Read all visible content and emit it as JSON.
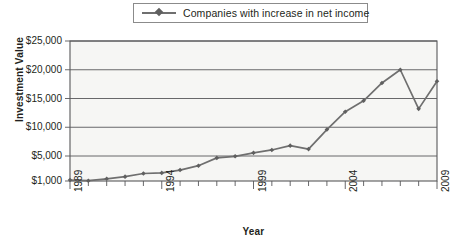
{
  "legend": {
    "entries": [
      {
        "label": "Companies with increase in net income",
        "color": "#6f6f6f",
        "marker": "diamond"
      }
    ]
  },
  "axes": {
    "y_title": "Investment Value",
    "x_title": "Year",
    "y_tick_labels": [
      "$25,000",
      "$20,000",
      "$15,000",
      "$10,000",
      "$5,000",
      "$1,000"
    ],
    "x_tick_labels": [
      "1989",
      "1994",
      "1999",
      "2004",
      "2009"
    ]
  },
  "chart_data": {
    "type": "line",
    "title": "",
    "subtitle": "",
    "xlabel": "Year",
    "ylabel": "Investment Value",
    "grid": true,
    "legend_position": "top-center",
    "x": [
      1989,
      1990,
      1991,
      1992,
      1993,
      1994,
      1995,
      1996,
      1997,
      1998,
      1999,
      2000,
      2001,
      2002,
      2003,
      2004,
      2005,
      2006,
      2007,
      2008,
      2009
    ],
    "x_tick_values": [
      1989,
      1994,
      1999,
      2004,
      2009
    ],
    "x_tick_labels": [
      "1989",
      "1994",
      "1999",
      "2004",
      "2009"
    ],
    "xlim": [
      1989,
      2009
    ],
    "y_tick_values": [
      1000,
      5000,
      10000,
      15000,
      20000,
      25000
    ],
    "y_tick_labels": [
      "$1,000",
      "$5,000",
      "$10,000",
      "$15,000",
      "$20,000",
      "$25,000"
    ],
    "ylim": [
      1000,
      25000
    ],
    "y_axis_note": "Baseline starts at $1,000; spacing from $1,000 to $5,000 is compressed relative to the other equal $5,000 intervals.",
    "series": [
      {
        "name": "Companies with increase in net income",
        "color": "#6f6f6f",
        "marker": "diamond",
        "values": [
          1150,
          1050,
          1350,
          1700,
          2200,
          2300,
          2750,
          3450,
          4700,
          4950,
          5550,
          6050,
          6800,
          6200,
          9600,
          12700,
          14600,
          17700,
          20000,
          13200,
          18000
        ]
      }
    ]
  }
}
